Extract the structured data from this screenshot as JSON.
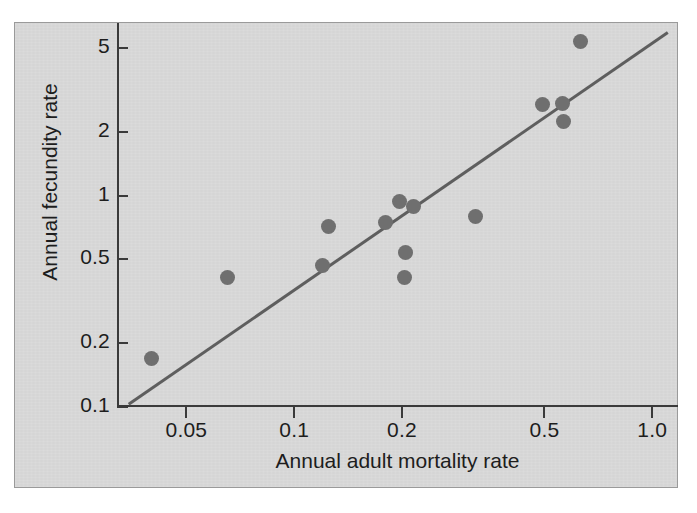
{
  "figure": {
    "background_color": "#d8d8d8",
    "axis_color": "#3a3a3a",
    "point_color": "#6f6f6f",
    "line_color": "#5e5e5e"
  },
  "chart_data": {
    "type": "scatter",
    "title": "",
    "xlabel": "Annual adult mortality rate",
    "ylabel": "Annual fecundity rate",
    "xscale": "log",
    "yscale": "log",
    "xlim": [
      0.032,
      1.18
    ],
    "ylim": [
      0.1,
      6.6
    ],
    "grid": false,
    "legend": null,
    "xticks": [
      0.05,
      0.1,
      0.2,
      0.5,
      1.0
    ],
    "xtick_labels": [
      "0.05",
      "0.1",
      "0.2",
      "0.5",
      "1.0"
    ],
    "yticks": [
      0.1,
      0.2,
      0.5,
      1,
      2,
      5
    ],
    "ytick_labels": [
      "0.1",
      "0.2",
      "0.5",
      "1",
      "2",
      "5"
    ],
    "points": [
      {
        "x": 0.04,
        "y": 0.17
      },
      {
        "x": 0.065,
        "y": 0.41
      },
      {
        "x": 0.12,
        "y": 0.47
      },
      {
        "x": 0.125,
        "y": 0.72
      },
      {
        "x": 0.18,
        "y": 0.75
      },
      {
        "x": 0.197,
        "y": 0.94
      },
      {
        "x": 0.215,
        "y": 0.89
      },
      {
        "x": 0.205,
        "y": 0.54
      },
      {
        "x": 0.203,
        "y": 0.41
      },
      {
        "x": 0.32,
        "y": 0.8
      },
      {
        "x": 0.495,
        "y": 2.7
      },
      {
        "x": 0.56,
        "y": 2.75
      },
      {
        "x": 0.565,
        "y": 2.25
      },
      {
        "x": 0.63,
        "y": 5.4
      }
    ],
    "fit_line": {
      "label": "regression line",
      "x_start": 0.0345,
      "y_start": 0.103,
      "x_end": 1.105,
      "y_end": 5.95
    },
    "series": [
      {
        "name": "species",
        "x": [
          0.04,
          0.065,
          0.12,
          0.125,
          0.18,
          0.197,
          0.215,
          0.205,
          0.203,
          0.32,
          0.495,
          0.56,
          0.565,
          0.63
        ],
        "y": [
          0.17,
          0.41,
          0.47,
          0.72,
          0.75,
          0.94,
          0.89,
          0.54,
          0.41,
          0.8,
          2.7,
          2.75,
          2.25,
          5.4
        ]
      }
    ]
  }
}
